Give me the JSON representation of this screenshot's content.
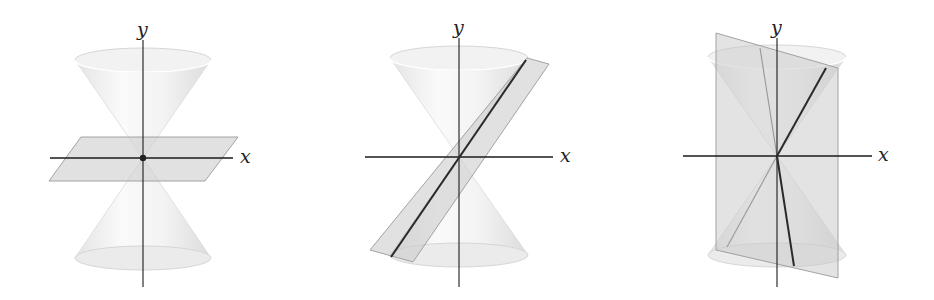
{
  "figure": {
    "panels": [
      {
        "id": "point",
        "x_label": "x",
        "y_label": "y",
        "intersection": "point"
      },
      {
        "id": "line",
        "x_label": "x",
        "y_label": "y",
        "intersection": "line"
      },
      {
        "id": "two-lines",
        "x_label": "x",
        "y_label": "y",
        "intersection": "two intersecting lines"
      }
    ]
  },
  "colors": {
    "cone_fill": "#ececec",
    "cone_edge": "#d0d0d0",
    "plane_fill": "#cfcfcf",
    "plane_edge": "#9a9a9a",
    "axis": "#1a1a1a",
    "intersection": "#2a2a2a"
  }
}
